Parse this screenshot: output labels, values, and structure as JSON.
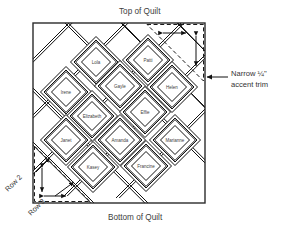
{
  "diagram": {
    "title_top": "Top of Quilt",
    "title_bottom": "Bottom of Quilt",
    "annotation_right_line1": "Narrow ¼\"",
    "annotation_right_line2": "accent trim",
    "row_label_2": "Row 2",
    "row_label_3": "Row 3",
    "colors": {
      "ink": "#2b2b2b",
      "text": "#3d3d3d",
      "background": "#ffffff",
      "dashed": "#1a1a1a"
    },
    "blocks": [
      {
        "name": "Lola",
        "cx": 96,
        "cy": 62
      },
      {
        "name": "Patti",
        "cx": 148,
        "cy": 60
      },
      {
        "name": "Irene",
        "cx": 66,
        "cy": 92
      },
      {
        "name": "Gayle",
        "cx": 120,
        "cy": 86
      },
      {
        "name": "Helen",
        "cx": 172,
        "cy": 87
      },
      {
        "name": "Elizabeth",
        "cx": 92,
        "cy": 116
      },
      {
        "name": "Effie",
        "cx": 145,
        "cy": 112
      },
      {
        "name": "Janet",
        "cx": 66,
        "cy": 140
      },
      {
        "name": "Amanda",
        "cx": 120,
        "cy": 140
      },
      {
        "name": "Marianne",
        "cx": 175,
        "cy": 140
      },
      {
        "name": "Kasey",
        "cx": 93,
        "cy": 167
      },
      {
        "name": "Francine",
        "cx": 146,
        "cy": 166
      }
    ]
  }
}
